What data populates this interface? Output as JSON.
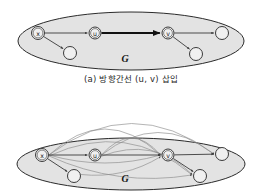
{
  "figures": [
    {
      "id": "figure-a",
      "caption": "(a) 방향간선 (u, v) 삽입",
      "graph_label": "G",
      "nodes": [
        {
          "id": "x",
          "label": "x",
          "cx": 38,
          "cy": 33,
          "r": 6.5,
          "labeled": true
        },
        {
          "id": "u",
          "label": "u",
          "cx": 95,
          "cy": 33,
          "r": 6.0,
          "labeled": true
        },
        {
          "id": "v",
          "label": "v",
          "cx": 168,
          "cy": 33,
          "r": 6.0,
          "labeled": true
        },
        {
          "id": "n1",
          "label": "",
          "cx": 70,
          "cy": 53,
          "r": 6.5,
          "labeled": false
        },
        {
          "id": "n2",
          "label": "",
          "cx": 196,
          "cy": 54,
          "r": 6.5,
          "labeled": false
        },
        {
          "id": "n3",
          "label": "",
          "cx": 222,
          "cy": 33,
          "r": 6.5,
          "labeled": false
        }
      ],
      "edges": [
        {
          "from": "x",
          "to": "u",
          "kind": "thin"
        },
        {
          "from": "u",
          "to": "v",
          "kind": "thick"
        },
        {
          "from": "x",
          "to": "n1",
          "kind": "thin"
        },
        {
          "from": "v",
          "to": "n2",
          "kind": "thin"
        },
        {
          "from": "v",
          "to": "n3",
          "kind": "thin"
        }
      ],
      "ellipse": {
        "cx": 131,
        "cy": 41,
        "rx": 113,
        "ry": 29
      }
    },
    {
      "id": "figure-b",
      "caption": "",
      "graph_label": "G",
      "nodes": [
        {
          "id": "x",
          "label": "x",
          "cx": 42,
          "cy": 63,
          "r": 6.5,
          "labeled": true
        },
        {
          "id": "u",
          "label": "u",
          "cx": 95,
          "cy": 63,
          "r": 6.0,
          "labeled": true
        },
        {
          "id": "v",
          "label": "v",
          "cx": 168,
          "cy": 63,
          "r": 6.0,
          "labeled": true
        },
        {
          "id": "n1",
          "label": "",
          "cx": 74,
          "cy": 84,
          "r": 6.5,
          "labeled": false
        },
        {
          "id": "n2",
          "label": "",
          "cx": 200,
          "cy": 84,
          "r": 6.5,
          "labeled": false
        },
        {
          "id": "n3",
          "label": "",
          "cx": 222,
          "cy": 62,
          "r": 6.5,
          "labeled": false
        }
      ],
      "edges": [
        {
          "from": "x",
          "to": "u",
          "kind": "thin"
        },
        {
          "from": "u",
          "to": "v",
          "kind": "thin"
        },
        {
          "from": "x",
          "to": "n1",
          "kind": "thin"
        },
        {
          "from": "v",
          "to": "n2",
          "kind": "thin"
        },
        {
          "from": "v",
          "to": "n3",
          "kind": "thin"
        }
      ],
      "arcs": [
        {
          "from": "x",
          "to": "v",
          "bow": -52
        },
        {
          "from": "x",
          "to": "n3",
          "bow": -62
        },
        {
          "from": "x",
          "to": "n2",
          "bow": -46
        },
        {
          "from": "u",
          "to": "v",
          "bow": -34
        },
        {
          "from": "u",
          "to": "n3",
          "bow": -44
        },
        {
          "from": "u",
          "to": "n2",
          "bow": -30
        },
        {
          "from": "x",
          "to": "v",
          "bow": 16
        },
        {
          "from": "x",
          "to": "n2",
          "bow": 22
        },
        {
          "from": "n1",
          "to": "v",
          "bow": 14
        }
      ],
      "ellipse": {
        "cx": 131,
        "cy": 72,
        "rx": 114,
        "ry": 26
      }
    }
  ],
  "colors": {
    "ellipse_fill": "#e3e3e3",
    "ellipse_stroke": "#2b2b2b",
    "node_fill": "#f0f0f0",
    "node_stroke": "#3a3a3a",
    "edge": "#3a3a3a",
    "edge_thick": "#111111",
    "arc": "#8a8a8a",
    "text": "#1a1a1a",
    "background": "#ffffff"
  }
}
